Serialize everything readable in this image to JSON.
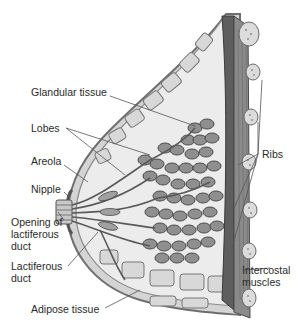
{
  "diagram": {
    "colors": {
      "background": "#ffffff",
      "label_text": "#2a2a2a",
      "leader_line": "#555555",
      "skin_outline": "#6e6e6e",
      "adipose_fill": "#e4e4e4",
      "lobule_fill": "#8f8f8f",
      "lobule_stroke": "#4a4a4a",
      "muscle_fill": "#7a7a7a",
      "rib_fill": "#dcdcdc"
    },
    "labels": {
      "glandular_tissue": "Glandular tissue",
      "lobes": "Lobes",
      "areola": "Areola",
      "nipple": "Nipple",
      "opening_of_lactiferous_duct": "Opening of\nlactiferous\nduct",
      "lactiferous_duct": "Lactiferous\nduct",
      "adipose_tissue": "Adipose tissue",
      "ribs": "Ribs",
      "intercostal_muscles": "Intercostal\nmuscles"
    }
  }
}
